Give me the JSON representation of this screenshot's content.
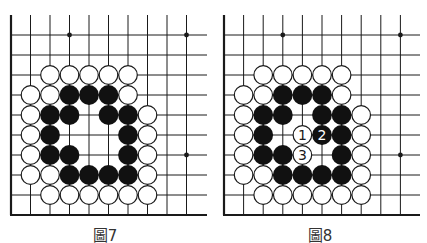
{
  "figures": [
    {
      "id": "fig7",
      "caption": "圖7",
      "origin_x": 11,
      "spacing_x": 19.5,
      "grid": {
        "cols": 10,
        "rows": 10,
        "top_y": 15,
        "first_row_y": 35,
        "spacing_y": 20,
        "bottom_y": 215,
        "right_x": 207
      },
      "star_points": [
        [
          3,
          0
        ],
        [
          9,
          0
        ],
        [
          9,
          6
        ]
      ],
      "stones": {
        "white": [
          [
            2,
            2
          ],
          [
            3,
            2
          ],
          [
            4,
            2
          ],
          [
            5,
            2
          ],
          [
            6,
            2
          ],
          [
            1,
            3
          ],
          [
            2,
            3
          ],
          [
            6,
            3
          ],
          [
            1,
            4
          ],
          [
            7,
            4
          ],
          [
            1,
            5
          ],
          [
            7,
            5
          ],
          [
            1,
            6
          ],
          [
            7,
            6
          ],
          [
            1,
            7
          ],
          [
            2,
            7
          ],
          [
            7,
            7
          ],
          [
            2,
            8
          ],
          [
            3,
            8
          ],
          [
            4,
            8
          ],
          [
            5,
            8
          ],
          [
            6,
            8
          ],
          [
            7,
            8
          ]
        ],
        "black": [
          [
            3,
            3
          ],
          [
            4,
            3
          ],
          [
            5,
            3
          ],
          [
            2,
            4
          ],
          [
            3,
            4
          ],
          [
            5,
            4
          ],
          [
            6,
            4
          ],
          [
            2,
            5
          ],
          [
            6,
            5
          ],
          [
            2,
            6
          ],
          [
            3,
            6
          ],
          [
            6,
            6
          ],
          [
            3,
            7
          ],
          [
            4,
            7
          ],
          [
            5,
            7
          ],
          [
            6,
            7
          ]
        ]
      },
      "numbered": []
    },
    {
      "id": "fig8",
      "caption": "圖8",
      "origin_x": 224,
      "spacing_x": 19.6,
      "grid": {
        "cols": 10,
        "rows": 10,
        "top_y": 15,
        "first_row_y": 35,
        "spacing_y": 20,
        "bottom_y": 215,
        "right_x": 420
      },
      "star_points": [
        [
          3,
          0
        ],
        [
          9,
          0
        ],
        [
          9,
          6
        ]
      ],
      "stones": {
        "white": [
          [
            2,
            2
          ],
          [
            3,
            2
          ],
          [
            4,
            2
          ],
          [
            5,
            2
          ],
          [
            6,
            2
          ],
          [
            1,
            3
          ],
          [
            2,
            3
          ],
          [
            6,
            3
          ],
          [
            1,
            4
          ],
          [
            7,
            4
          ],
          [
            1,
            5
          ],
          [
            7,
            5
          ],
          [
            1,
            6
          ],
          [
            7,
            6
          ],
          [
            1,
            7
          ],
          [
            2,
            7
          ],
          [
            7,
            7
          ],
          [
            2,
            8
          ],
          [
            3,
            8
          ],
          [
            4,
            8
          ],
          [
            5,
            8
          ],
          [
            6,
            8
          ],
          [
            7,
            8
          ]
        ],
        "black": [
          [
            3,
            3
          ],
          [
            4,
            3
          ],
          [
            5,
            3
          ],
          [
            2,
            4
          ],
          [
            3,
            4
          ],
          [
            5,
            4
          ],
          [
            6,
            4
          ],
          [
            2,
            5
          ],
          [
            6,
            5
          ],
          [
            2,
            6
          ],
          [
            3,
            6
          ],
          [
            6,
            6
          ],
          [
            3,
            7
          ],
          [
            4,
            7
          ],
          [
            5,
            7
          ],
          [
            6,
            7
          ]
        ]
      },
      "numbered": [
        {
          "color": "white",
          "col": 4,
          "row": 5,
          "label": "1"
        },
        {
          "color": "black",
          "col": 5,
          "row": 5,
          "label": "2"
        },
        {
          "color": "white",
          "col": 4,
          "row": 6,
          "label": "3"
        }
      ]
    }
  ],
  "colors": {
    "line": "#1a1a1a",
    "black_stone": "#111111",
    "white_stone": "#ffffff",
    "caption": "#333333"
  }
}
